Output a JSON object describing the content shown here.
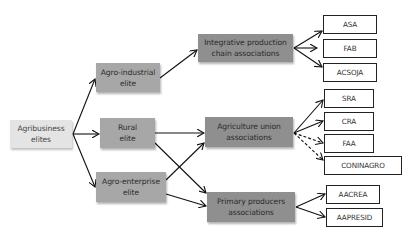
{
  "diagram": {
    "type": "flowchart",
    "root": {
      "id": "root",
      "label": "Agribusiness elites"
    },
    "elites": [
      {
        "id": "agro_industrial",
        "label": "Agro-industrial elite",
        "line1": "Agro-industrial",
        "line2": "elite"
      },
      {
        "id": "rural",
        "label": "Rural elite",
        "line1": "Rural",
        "line2": "elite"
      },
      {
        "id": "agro_enterprise",
        "label": "Agro-enterprise elite",
        "line1": "Agro-enterprise",
        "line2": "elite"
      }
    ],
    "associations": [
      {
        "id": "integrative",
        "label": "Integrative production chain associations",
        "line1": "Integrative production",
        "line2": "chain associations"
      },
      {
        "id": "agri_union",
        "label": "Agriculture union associations",
        "line1": "Agriculture union",
        "line2": "associations"
      },
      {
        "id": "primary",
        "label": "Primary producers associations",
        "line1": "Primary producers",
        "line2": "associations"
      }
    ],
    "root_line1": "Agribusiness",
    "root_line2": "elites",
    "organizations": [
      {
        "id": "asa",
        "label": "ASA"
      },
      {
        "id": "fab",
        "label": "FAB"
      },
      {
        "id": "acsoja",
        "label": "ACSOJA"
      },
      {
        "id": "sra",
        "label": "SRA"
      },
      {
        "id": "cra",
        "label": "CRA"
      },
      {
        "id": "faa",
        "label": "FAA"
      },
      {
        "id": "coninagro",
        "label": "CONINAGRO"
      },
      {
        "id": "aacrea",
        "label": "AACREA"
      },
      {
        "id": "aapresid",
        "label": "AAPRESID"
      }
    ],
    "edges": [
      {
        "from": "root",
        "to": "agro_industrial",
        "style": "solid"
      },
      {
        "from": "root",
        "to": "rural",
        "style": "solid"
      },
      {
        "from": "root",
        "to": "agro_enterprise",
        "style": "solid"
      },
      {
        "from": "agro_industrial",
        "to": "integrative",
        "style": "solid"
      },
      {
        "from": "rural",
        "to": "agri_union",
        "style": "solid"
      },
      {
        "from": "rural",
        "to": "primary",
        "style": "solid"
      },
      {
        "from": "agro_enterprise",
        "to": "agri_union",
        "style": "solid"
      },
      {
        "from": "agro_enterprise",
        "to": "primary",
        "style": "solid"
      },
      {
        "from": "integrative",
        "to": "asa",
        "style": "solid"
      },
      {
        "from": "integrative",
        "to": "fab",
        "style": "solid"
      },
      {
        "from": "integrative",
        "to": "acsoja",
        "style": "solid"
      },
      {
        "from": "agri_union",
        "to": "sra",
        "style": "solid"
      },
      {
        "from": "agri_union",
        "to": "cra",
        "style": "solid"
      },
      {
        "from": "agri_union",
        "to": "faa",
        "style": "dashed"
      },
      {
        "from": "agri_union",
        "to": "coninagro",
        "style": "dashed"
      },
      {
        "from": "primary",
        "to": "aacrea",
        "style": "solid"
      },
      {
        "from": "primary",
        "to": "aapresid",
        "style": "solid"
      }
    ],
    "colors": {
      "root_fill": "#e4e4e4",
      "elite_fill": "#a7a7a7",
      "association_fill": "#8f8f8f",
      "org_fill": "#ffffff",
      "org_border": "#222222",
      "edge": "#111111"
    }
  }
}
